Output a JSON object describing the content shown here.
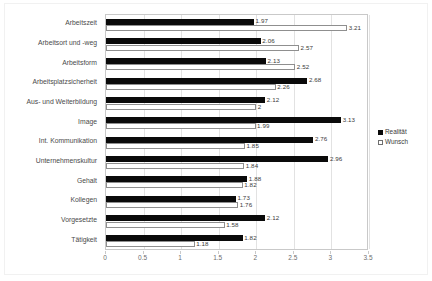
{
  "chart_data": {
    "type": "bar",
    "orientation": "horizontal",
    "title": "",
    "subtitle": "",
    "xlabel": "",
    "ylabel": "",
    "xlim": [
      0,
      3.5
    ],
    "xticks": [
      "0",
      "0.5",
      "1",
      "1.5",
      "2",
      "2.5",
      "3",
      "3.5"
    ],
    "xtick_values": [
      0,
      0.5,
      1,
      1.5,
      2,
      2.5,
      3,
      3.5
    ],
    "grid": true,
    "grid_axis": "x",
    "legend_position": "right",
    "categories": [
      "Arbeitszeit",
      "Arbeitsort und -weg",
      "Arbeitsform",
      "Arbeitsplatzsicherheit",
      "Aus- und Weiterbildung",
      "Image",
      "Int. Kommunikation",
      "Unternehmenskultur",
      "Gehalt",
      "Kollegen",
      "Vorgesetzte",
      "Tätigkeit"
    ],
    "series": [
      {
        "name": "Realität",
        "color": "#0a0a0a",
        "style": "filled",
        "values": [
          1.97,
          2.06,
          2.13,
          2.68,
          2.12,
          3.13,
          2.76,
          2.96,
          1.88,
          1.73,
          2.12,
          1.82
        ],
        "labels": [
          "1.97",
          "2.06",
          "2.13",
          "2.68",
          "2.12",
          "3.13",
          "2.76",
          "2.96",
          "1.88",
          "1.73",
          "2.12",
          "1.82"
        ]
      },
      {
        "name": "Wunsch",
        "color": "#ffffff",
        "style": "hollow",
        "values": [
          3.21,
          2.57,
          2.52,
          2.26,
          2,
          1.99,
          1.85,
          1.84,
          1.82,
          1.76,
          1.58,
          1.18
        ],
        "labels": [
          "3.21",
          "2.57",
          "2.52",
          "2.26",
          "2",
          "1.99",
          "1.85",
          "1.84",
          "1.82",
          "1.76",
          "1.58",
          "1.18"
        ]
      }
    ]
  },
  "legend": {
    "items": [
      {
        "label": "Realität",
        "style": "filled"
      },
      {
        "label": "Wunsch",
        "style": "hollow"
      }
    ]
  }
}
